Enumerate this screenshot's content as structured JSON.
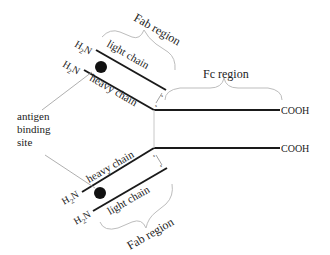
{
  "diagram": {
    "labels": {
      "fab_top": "Fab region",
      "fab_bottom": "Fab region",
      "fc": "Fc region",
      "light_chain_top": "light chain",
      "heavy_chain_top": "heavy chain",
      "heavy_chain_bottom": "heavy chain",
      "light_chain_bottom": "light chain",
      "cooh_top": "COOH",
      "cooh_bottom": "COOH",
      "antigen_line1": "antigen",
      "antigen_line2": "binding",
      "antigen_line3": "site",
      "h2n": "H",
      "h2n_sub": "2",
      "h2n_n": "N",
      "disulfide": "s"
    },
    "colors": {
      "chain": "#1a1a1a",
      "brace": "#bdbdbd",
      "pointer": "#9a9a9a",
      "text": "#222222"
    }
  }
}
